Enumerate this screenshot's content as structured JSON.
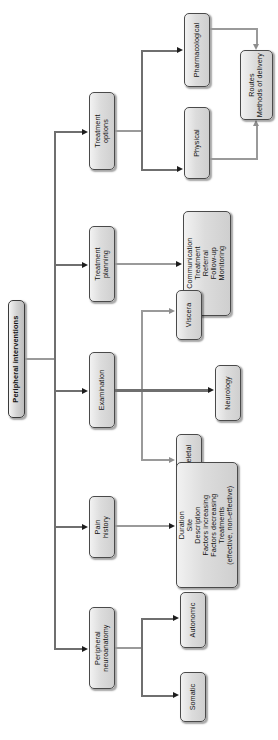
{
  "diagram": {
    "title": "Peripheral interventions",
    "orientation": "left-to-right tree, rendered rotated 90 degrees",
    "root": {
      "label": "Peripheral interventions"
    },
    "branches": [
      {
        "id": "treatment-options",
        "label": "Treatment\noptions",
        "children": [
          {
            "id": "pharmacological",
            "label": "Pharmacological"
          },
          {
            "id": "physical",
            "label": "Physical"
          }
        ],
        "converges_to": {
          "id": "routes-methods",
          "label": "Routes\nMethods of delivery"
        }
      },
      {
        "id": "treatment-planning",
        "label": "Treatment\nplanning",
        "children": [
          {
            "id": "planning-details",
            "label": "Communication\nTreatment\nReferral\nFollow-up\nMonitoring"
          }
        ]
      },
      {
        "id": "examination",
        "label": "Examination",
        "children": [
          {
            "id": "viscera",
            "label": "Viscera"
          },
          {
            "id": "neurology",
            "label": "Neurology"
          },
          {
            "id": "m-skeletal",
            "label": "M/Skeletal"
          }
        ]
      },
      {
        "id": "pain-history",
        "label": "Pain\nhistory",
        "children": [
          {
            "id": "pain-details",
            "label": "Duration\nSite\nDescription\nFactors increasing\nFactors decreasing\nTreatments\n(effective, non-effective)"
          }
        ]
      },
      {
        "id": "peripheral-neuroanatomy",
        "label": "Peripheral\nneuroanatomy",
        "children": [
          {
            "id": "autonomic",
            "label": "Autonomic"
          },
          {
            "id": "somatic",
            "label": "Somatic"
          }
        ]
      }
    ],
    "colors": {
      "node_fill_light": "#f2f2f2",
      "node_fill_dark": "#cfcfcf",
      "node_border": "#4a4a4a",
      "connector_dark": "#6f6f6f",
      "connector_light": "#9a9a9a",
      "arrow": "#1d1d1d",
      "page_background": "#ffffff",
      "text": "#131313"
    }
  }
}
